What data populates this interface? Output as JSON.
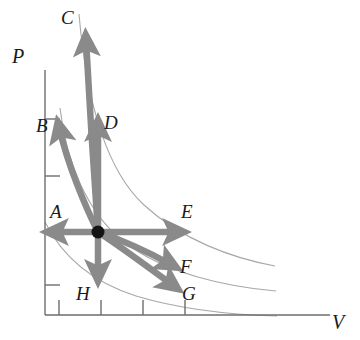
{
  "figure": {
    "type": "pv-diagram",
    "background_color": "#ffffff",
    "arrow_color": "#8a8a8a",
    "isotherm_color": "#a8a8a8",
    "axis_color": "#6d6d6d",
    "label_color": "#1a1a1a"
  },
  "axes": {
    "y_label": "P",
    "x_label": "V",
    "y_tick_count": 4,
    "x_tick_count": 4,
    "origin": {
      "x": 45,
      "y": 315
    }
  },
  "state_point": {
    "name": "initial-state",
    "x": 98,
    "y": 232
  },
  "arrows": [
    {
      "label": "A",
      "direction": "left",
      "shape": "straight",
      "tip": {
        "x": 46,
        "y": 232
      },
      "label_pos": {
        "x": 50,
        "y": 202
      }
    },
    {
      "label": "B",
      "direction": "up-left",
      "shape": "curved",
      "tip": {
        "x": 57,
        "y": 118
      },
      "label_pos": {
        "x": 36,
        "y": 116
      }
    },
    {
      "label": "C",
      "direction": "up",
      "shape": "curved",
      "tip": {
        "x": 86,
        "y": 30
      },
      "label_pos": {
        "x": 61,
        "y": 8
      }
    },
    {
      "label": "D",
      "direction": "up",
      "shape": "straight",
      "tip": {
        "x": 98,
        "y": 116
      },
      "label_pos": {
        "x": 104,
        "y": 113
      }
    },
    {
      "label": "E",
      "direction": "right",
      "shape": "straight",
      "tip": {
        "x": 185,
        "y": 232
      },
      "label_pos": {
        "x": 181,
        "y": 202
      }
    },
    {
      "label": "F",
      "direction": "down-right",
      "shape": "curved",
      "tip": {
        "x": 178,
        "y": 268
      },
      "label_pos": {
        "x": 180,
        "y": 257
      }
    },
    {
      "label": "G",
      "direction": "down-right",
      "shape": "curved",
      "tip": {
        "x": 180,
        "y": 289
      },
      "label_pos": {
        "x": 182,
        "y": 284
      }
    },
    {
      "label": "H",
      "direction": "down",
      "shape": "straight",
      "tip": {
        "x": 98,
        "y": 283
      },
      "label_pos": {
        "x": 76,
        "y": 284
      }
    }
  ]
}
